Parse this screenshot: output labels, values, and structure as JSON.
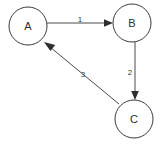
{
  "diagram": {
    "type": "directed-graph",
    "canvas": {
      "width": 166,
      "height": 144,
      "background": "#ffffff"
    },
    "style": {
      "node_stroke": "#3a3a3a",
      "node_fill": "#ffffff",
      "node_stroke_width": 1,
      "edge_stroke": "#4a4a4a",
      "edge_stroke_width": 1,
      "arrow_fill": "#2e2e2e",
      "node_label_color": "#2e2e2e",
      "edge_label_color": "#3a3a3a",
      "node_radius": 19
    },
    "nodes": [
      {
        "id": "A",
        "label": "A",
        "cx": 28,
        "cy": 26,
        "r": 19
      },
      {
        "id": "B",
        "label": "B",
        "cx": 132,
        "cy": 23,
        "r": 19
      },
      {
        "id": "C",
        "label": "C",
        "cx": 134,
        "cy": 119,
        "r": 19
      }
    ],
    "edges": [
      {
        "id": "edge-1",
        "from": "A",
        "to": "B",
        "label": "1",
        "orientation": "horizontal",
        "x1": 47,
        "y1": 23,
        "x2": 113,
        "y2": 23,
        "label_x": 80,
        "label_y": 20,
        "arrow_tip_x": 113,
        "arrow_tip_y": 23,
        "arrow_angle_deg": 0
      },
      {
        "id": "edge-2",
        "from": "B",
        "to": "C",
        "label": "2",
        "orientation": "vertical",
        "x1": 135,
        "y1": 42,
        "x2": 135,
        "y2": 100,
        "label_x": 130,
        "label_y": 72,
        "arrow_tip_x": 135,
        "arrow_tip_y": 100,
        "arrow_angle_deg": 90
      },
      {
        "id": "edge-3",
        "from": "C",
        "to": "A",
        "label": "3",
        "orientation": "diagonal",
        "x1": 119,
        "y1": 104,
        "x2": 44,
        "y2": 42,
        "label_x": 82,
        "label_y": 73,
        "arrow_tip_x": 44,
        "arrow_tip_y": 42,
        "arrow_angle_deg": 219
      }
    ]
  }
}
